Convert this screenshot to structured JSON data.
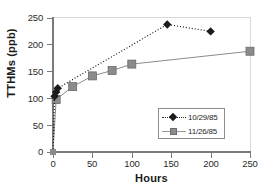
{
  "chart_data": {
    "type": "line",
    "title": "",
    "xlabel": "Hours",
    "ylabel": "TTHMs (ppb)",
    "xlim": [
      0,
      250
    ],
    "ylim": [
      0,
      250
    ],
    "xticks": [
      0,
      50,
      100,
      150,
      200,
      250
    ],
    "yticks": [
      0,
      50,
      100,
      150,
      200,
      250
    ],
    "grid": false,
    "legend_position": "inside-lower-right",
    "series": [
      {
        "name": "10/29/85",
        "marker": "diamond",
        "linestyle": "dotted",
        "color": "#1c1c1c",
        "points": [
          {
            "x": 0,
            "y": 0
          },
          {
            "x": 2,
            "y": 104
          },
          {
            "x": 4,
            "y": 112
          },
          {
            "x": 6,
            "y": 119
          },
          {
            "x": 145,
            "y": 238
          },
          {
            "x": 200,
            "y": 225
          }
        ]
      },
      {
        "name": "11/26/85",
        "marker": "square",
        "linestyle": "solid",
        "color": "#8b8b8b",
        "points": [
          {
            "x": 0,
            "y": 0
          },
          {
            "x": 4,
            "y": 98
          },
          {
            "x": 25,
            "y": 122
          },
          {
            "x": 50,
            "y": 142
          },
          {
            "x": 75,
            "y": 152
          },
          {
            "x": 100,
            "y": 164
          },
          {
            "x": 250,
            "y": 188
          }
        ]
      }
    ]
  },
  "axes": {
    "y_tick_labels": [
      "250",
      "200",
      "150",
      "100",
      "50",
      "0"
    ],
    "x_tick_labels": [
      "0",
      "50",
      "100",
      "150",
      "200",
      "250"
    ],
    "x_axis_title": "Hours",
    "y_axis_title": "TTHMs (ppb)"
  },
  "legend": {
    "entries": [
      {
        "label": "10/29/85",
        "marker": "diamond-marker",
        "line": "dotted"
      },
      {
        "label": "11/26/85",
        "marker": "square-marker",
        "line": "solid"
      }
    ]
  },
  "colors": {
    "series1": "#1c1c1c",
    "series2": "#8b8b8b",
    "axis": "#7a7a7a",
    "text": "#1a1a1a",
    "background": "#ffffff"
  }
}
